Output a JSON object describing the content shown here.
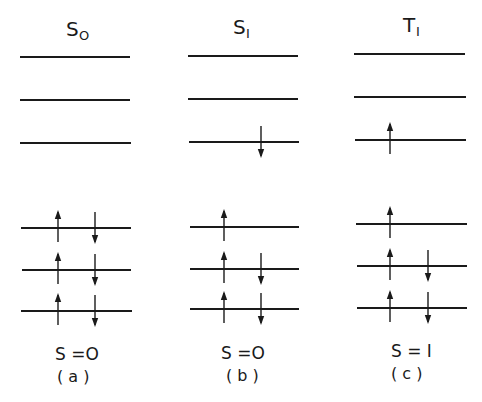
{
  "diagram": {
    "columns": [
      {
        "id": "a",
        "state_label": "S",
        "state_subscript": "0",
        "spin_label": "S = 0",
        "panel_label": "(a)",
        "upper_levels": [
          {
            "y": 57,
            "x1": 20,
            "x2": 130,
            "electrons": []
          },
          {
            "y": 100,
            "x1": 20,
            "x2": 130,
            "electrons": []
          },
          {
            "y": 143,
            "x1": 20,
            "x2": 131,
            "electrons": []
          }
        ],
        "lower_levels": [
          {
            "y": 228,
            "x1": 21,
            "x2": 131,
            "electrons": [
              "up",
              "down"
            ]
          },
          {
            "y": 270,
            "x1": 22,
            "x2": 131,
            "electrons": [
              "up",
              "down"
            ]
          },
          {
            "y": 311,
            "x1": 21,
            "x2": 132,
            "electrons": [
              "up",
              "down"
            ]
          }
        ],
        "arrow_x": {
          "up": 58,
          "down": 95
        }
      },
      {
        "id": "b",
        "state_label": "S",
        "state_subscript": "1",
        "spin_label": "S = 0",
        "panel_label": "(b)",
        "upper_levels": [
          {
            "y": 56,
            "x1": 188,
            "x2": 298,
            "electrons": []
          },
          {
            "y": 99,
            "x1": 188,
            "x2": 298,
            "electrons": []
          },
          {
            "y": 142,
            "x1": 189,
            "x2": 299,
            "electrons": [
              "down"
            ]
          }
        ],
        "lower_levels": [
          {
            "y": 227,
            "x1": 190,
            "x2": 299,
            "electrons": [
              "up"
            ]
          },
          {
            "y": 269,
            "x1": 190,
            "x2": 299,
            "electrons": [
              "up",
              "down"
            ]
          },
          {
            "y": 309,
            "x1": 190,
            "x2": 299,
            "electrons": [
              "up",
              "down"
            ]
          }
        ],
        "arrow_x": {
          "up": 224,
          "down": 261
        }
      },
      {
        "id": "c",
        "state_label": "T",
        "state_subscript": "1",
        "spin_label": "S = 1",
        "panel_label": "(c)",
        "upper_levels": [
          {
            "y": 54,
            "x1": 354,
            "x2": 465,
            "electrons": []
          },
          {
            "y": 97,
            "x1": 354,
            "x2": 466,
            "electrons": []
          },
          {
            "y": 140,
            "x1": 355,
            "x2": 466,
            "electrons": [
              "up"
            ]
          }
        ],
        "lower_levels": [
          {
            "y": 224,
            "x1": 356,
            "x2": 467,
            "electrons": [
              "up"
            ]
          },
          {
            "y": 266,
            "x1": 357,
            "x2": 467,
            "electrons": [
              "up",
              "down"
            ]
          },
          {
            "y": 308,
            "x1": 357,
            "x2": 467,
            "electrons": [
              "up",
              "down"
            ]
          }
        ],
        "arrow_x": {
          "up": 390,
          "down": 428
        }
      }
    ]
  },
  "labels": {
    "a_state": "S",
    "a_sub": "O",
    "b_state": "S",
    "b_sub": "I",
    "c_state": "T",
    "c_sub": "I",
    "a_spin": "S =O",
    "b_spin": "S =O",
    "c_spin": "S = I",
    "a_panel": "( a )",
    "b_panel": "( b )",
    "c_panel": "( c )"
  },
  "colors": {
    "ink": "#1a1a1a",
    "background": "#ffffff"
  }
}
